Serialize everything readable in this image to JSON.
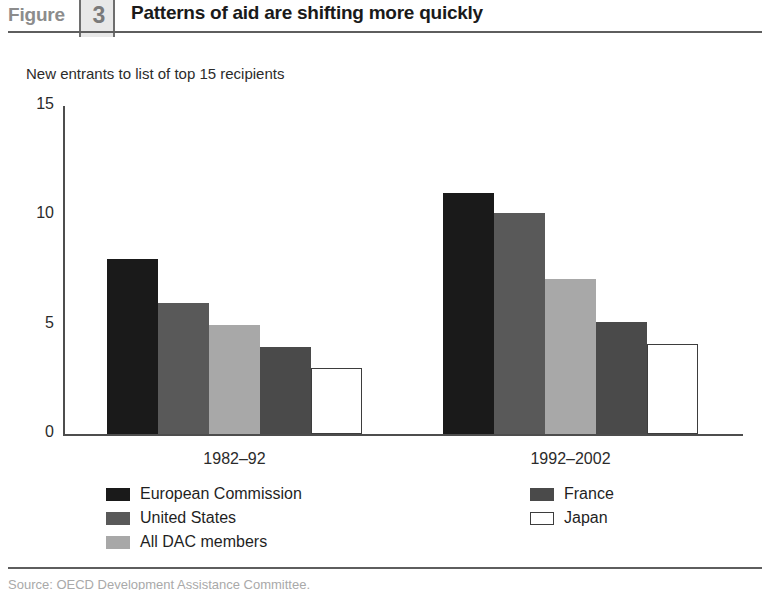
{
  "header": {
    "figure_word": "Figure",
    "figure_number": "3",
    "title": "Patterns of aid are shifting more quickly"
  },
  "footer": {
    "source_note": "Source: OECD Development Assistance Committee."
  },
  "colors": {
    "european_commission": "#1a1a1a",
    "united_states": "#595959",
    "all_dac_members": "#a8a8a8",
    "france": "#4a4a4a",
    "japan": "#ffffff",
    "japan_border": "#3d3d3d",
    "axis": "#4d4d4d",
    "rule": "#5e5e5e",
    "figure_box_fill": "#e8e8e8",
    "figure_box_border": "#6e6e6e",
    "figure_word_text": "#8c8c8c"
  },
  "chart_data": {
    "type": "bar",
    "title": "Patterns of aid are shifting more quickly",
    "subtitle": "New entrants to list of top 15 recipients",
    "xlabel": "",
    "ylabel": "",
    "ylim": [
      0,
      15
    ],
    "yticks": [
      0,
      5,
      10,
      15
    ],
    "ytick_labels": [
      "0",
      "5",
      "10",
      "15"
    ],
    "grid": false,
    "legend_position": "bottom",
    "categories": [
      "1982–92",
      "1992–2002"
    ],
    "series": [
      {
        "name": "European Commission",
        "values": [
          8,
          11
        ],
        "color": "#1a1a1a"
      },
      {
        "name": "United States",
        "values": [
          6,
          10.1
        ],
        "color": "#595959"
      },
      {
        "name": "All DAC members",
        "values": [
          5,
          7.1
        ],
        "color": "#a8a8a8"
      },
      {
        "name": "France",
        "values": [
          4,
          5.1
        ],
        "color": "#4a4a4a"
      },
      {
        "name": "Japan",
        "values": [
          3,
          4.1
        ],
        "color": "#ffffff"
      }
    ]
  }
}
